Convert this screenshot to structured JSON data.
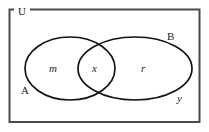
{
  "diagram": {
    "type": "venn",
    "universe": {
      "label": "U",
      "label_position": "top-left-border-gap"
    },
    "sets": [
      {
        "key": "A",
        "label": "A",
        "label_position": "bottom-left-outside"
      },
      {
        "key": "B",
        "label": "B",
        "label_position": "top-right-outside"
      }
    ],
    "regions": [
      {
        "key": "a_only",
        "label": "m",
        "style": "italic",
        "description": "in A only"
      },
      {
        "key": "intersection",
        "label": "x",
        "style": "italic",
        "description": "in A and B"
      },
      {
        "key": "b_only",
        "label": "r",
        "style": "italic",
        "description": "in B only"
      },
      {
        "key": "outside",
        "label": "y",
        "style": "italic",
        "description": "outside A and B, inside U"
      }
    ],
    "colors": {
      "border": "#4a4a4a",
      "curve": "#131313",
      "text": "#1a1a1a",
      "background": "#ffffff"
    }
  }
}
